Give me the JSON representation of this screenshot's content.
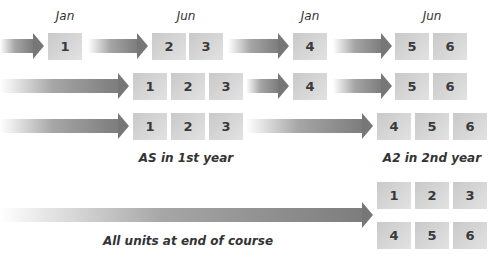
{
  "columns": [
    {
      "label": "Jan",
      "x": 65
    },
    {
      "label": "Jun",
      "x": 186
    },
    {
      "label": "Jan",
      "x": 310
    },
    {
      "label": "Jun",
      "x": 432
    }
  ],
  "captions": {
    "as_first_year": "AS in 1st year",
    "a2_second_year": "A2 in 2nd year",
    "all_units": "All units at end of course"
  },
  "rows": [
    {
      "name": "row-modular-staged",
      "arrows": [
        {
          "x": 0,
          "w": 44,
          "y": 33
        },
        {
          "x": 88,
          "w": 60,
          "y": 33
        },
        {
          "x": 228,
          "w": 61,
          "y": 33
        },
        {
          "x": 333,
          "w": 59,
          "y": 33
        }
      ],
      "units": [
        {
          "n": "1",
          "x": 48,
          "y": 33
        },
        {
          "n": "2",
          "x": 152,
          "y": 33
        },
        {
          "n": "3",
          "x": 189,
          "y": 33
        },
        {
          "n": "4",
          "x": 293,
          "y": 33
        },
        {
          "n": "5",
          "x": 395,
          "y": 33
        },
        {
          "n": "6",
          "x": 433,
          "y": 33
        }
      ]
    },
    {
      "name": "row-as-jun-a2-staged",
      "arrows": [
        {
          "x": 0,
          "w": 129,
          "y": 73
        },
        {
          "x": 246,
          "w": 43,
          "y": 73
        },
        {
          "x": 333,
          "w": 59,
          "y": 73
        }
      ],
      "units": [
        {
          "n": "1",
          "x": 133,
          "y": 73
        },
        {
          "n": "2",
          "x": 171,
          "y": 73
        },
        {
          "n": "3",
          "x": 209,
          "y": 73
        },
        {
          "n": "4",
          "x": 293,
          "y": 73
        },
        {
          "n": "5",
          "x": 395,
          "y": 73
        },
        {
          "n": "6",
          "x": 433,
          "y": 73
        }
      ]
    },
    {
      "name": "row-as-a2-end-of-year",
      "arrows": [
        {
          "x": 0,
          "w": 129,
          "y": 113
        },
        {
          "x": 246,
          "w": 127,
          "y": 113
        }
      ],
      "units": [
        {
          "n": "1",
          "x": 133,
          "y": 113
        },
        {
          "n": "2",
          "x": 171,
          "y": 113
        },
        {
          "n": "3",
          "x": 209,
          "y": 113
        },
        {
          "n": "4",
          "x": 377,
          "y": 113
        },
        {
          "n": "5",
          "x": 415,
          "y": 113
        },
        {
          "n": "6",
          "x": 453,
          "y": 113
        }
      ]
    },
    {
      "name": "row-linear",
      "arrows": [
        {
          "x": 0,
          "w": 373,
          "y": 202
        }
      ],
      "units": [
        {
          "n": "1",
          "x": 377,
          "y": 182
        },
        {
          "n": "2",
          "x": 415,
          "y": 182
        },
        {
          "n": "3",
          "x": 453,
          "y": 182
        },
        {
          "n": "4",
          "x": 377,
          "y": 222
        },
        {
          "n": "5",
          "x": 415,
          "y": 222
        },
        {
          "n": "6",
          "x": 453,
          "y": 222
        }
      ]
    }
  ]
}
